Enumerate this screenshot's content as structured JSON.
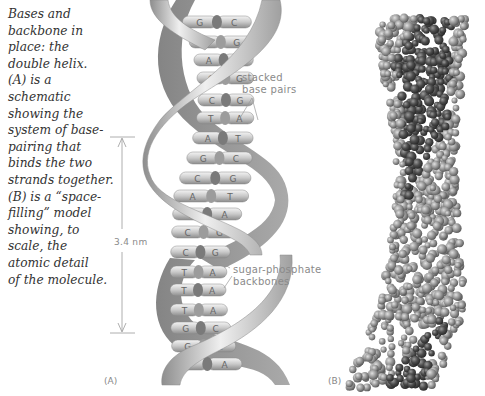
{
  "caption": {
    "lines": [
      "Bases and",
      "backbone in",
      "place: the",
      "double helix.",
      "(A) is a",
      "schematic",
      "showing the",
      "system of base-",
      "pairing that",
      "binds the two",
      "strands together.",
      "(B) is a “space-",
      "filling” model",
      "showing, to",
      "scale, the",
      "atomic detail",
      "of the molecule."
    ]
  },
  "panel_a": {
    "label": "(A)",
    "dimension": {
      "label": "3.4 nm"
    },
    "annotations": {
      "stacked_base_pairs": [
        "stacked",
        "base pairs"
      ],
      "sugar_phosphate_backbones": [
        "sugar-phosphate",
        "backbones"
      ]
    },
    "base_pairs": [
      [
        "G",
        "C"
      ],
      [
        "C",
        "G"
      ],
      [
        "A",
        "T"
      ],
      [
        "C",
        "G"
      ],
      [
        "C",
        "G"
      ],
      [
        "T",
        "A"
      ],
      [
        "A",
        "T"
      ],
      [
        "G",
        "C"
      ],
      [
        "C",
        "G"
      ],
      [
        "A",
        "T"
      ],
      [
        "T",
        "A"
      ],
      [
        "C",
        "G"
      ],
      [
        "C",
        "G"
      ],
      [
        "T",
        "A"
      ],
      [
        "T",
        "A"
      ],
      [
        "T",
        "A"
      ],
      [
        "G",
        "C"
      ],
      [
        "G",
        "C"
      ],
      [
        "T",
        "A"
      ]
    ]
  },
  "panel_b": {
    "label": "(B)"
  },
  "colors": {
    "caption_text": "#333333",
    "annotation_text": "#8a8a8a",
    "backbone_light": "#e6e6e6",
    "backbone_dark": "#9a9a9a",
    "atom_light": "#a8a8a8",
    "atom_dark": "#4a4a4a"
  }
}
